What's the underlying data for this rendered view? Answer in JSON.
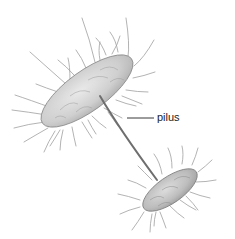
{
  "figure": {
    "labels": [
      {
        "text": "pilus",
        "target": "pilus"
      }
    ],
    "colors": {
      "cell_fill": "#d6d6d6",
      "cell_outline": "#8a8a8a",
      "hair": "#9a9a9a",
      "pilus": "#6e6e6e",
      "label_text": "#222222",
      "leader_line": "#222222"
    }
  }
}
